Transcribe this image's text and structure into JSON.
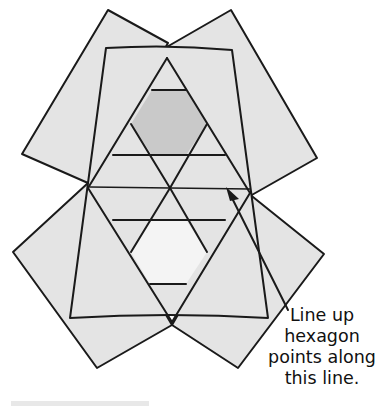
{
  "figure": {
    "caption_lines": [
      "Line up",
      "hexagon",
      "points along",
      "this line."
    ],
    "colors": {
      "fabric": "#e4e4e4",
      "stroke": "#1a1a1a",
      "top_hexagon": "#c9c9c9",
      "bottom_hexagon": "#f4f4f4",
      "background": "#ffffff"
    },
    "shapes": {
      "top_left_square": "108,10 168,43 88,183 22,154",
      "top_right_square": "231,10 317,158 250,196 165,48",
      "bottom_left_square": "13,252 88,183 172,325 97,368",
      "bottom_right_square": "324,254 248,193 172,325 238,368",
      "trapezoid": "106,48 232,50 268,318 70,318",
      "top_hexagon": "152,90 186,90 207,124 186,155 152,155 131,124",
      "bottom_hexagon": "150,220 186,220 207,252 186,284 150,284 131,252"
    }
  }
}
